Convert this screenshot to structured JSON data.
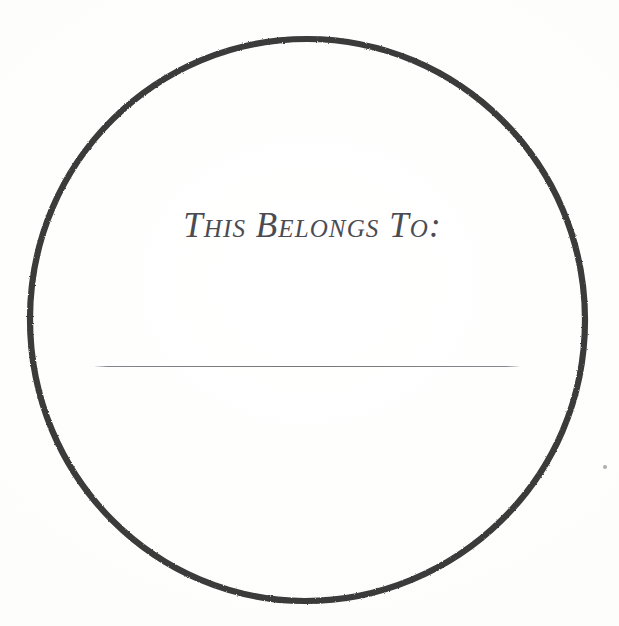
{
  "document": {
    "kind": "bookplate-label",
    "title": "This Belongs To label",
    "background_color": "#fdfdfd",
    "width": 619,
    "height": 626
  },
  "circle": {
    "name": "hand-drawn-circle-border",
    "center_x": 307,
    "center_y": 320,
    "radius_x": 277,
    "radius_y": 281,
    "stroke_color": "#3a3a3a",
    "stroke_width": 6
  },
  "label": {
    "heading": "This Belongs To:",
    "heading_color": "#4b4b53",
    "heading_font_size": 35
  },
  "signature": {
    "name": "signature-line",
    "line_color": "#7c7c80",
    "line_x_start": 95,
    "line_x_end": 519,
    "line_y": 366,
    "line_thickness": 1,
    "value": "",
    "placeholder": ""
  },
  "artifacts": {
    "speck_color": "#6e6e70",
    "speck_x": 605,
    "speck_y": 467
  }
}
